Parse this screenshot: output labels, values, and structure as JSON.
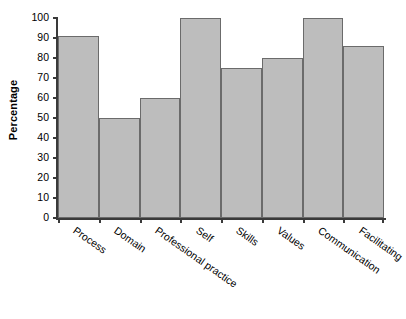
{
  "chart_data": {
    "type": "bar",
    "title": "",
    "subtitle": "",
    "xlabel": "",
    "ylabel": "Percentage",
    "categories": [
      "Process",
      "Domain",
      "Professional practice",
      "Self",
      "Skills",
      "Values",
      "Communication",
      "Facilitating"
    ],
    "values": [
      91,
      50,
      60,
      100,
      75,
      80,
      100,
      86
    ],
    "ylim": [
      0,
      100
    ],
    "ytick_labels": [
      "0",
      "10",
      "20",
      "30",
      "40",
      "50",
      "60",
      "70",
      "80",
      "90",
      "100"
    ],
    "ytick_values": [
      0,
      10,
      20,
      30,
      40,
      50,
      60,
      70,
      80,
      90,
      100
    ],
    "grid": false,
    "legend": null,
    "bar_fill_color": "#bdbdbd",
    "bar_edge_color": "#6b6b6b",
    "axis_color": "#3a3a3a",
    "background_color": "#ffffff",
    "bars_adjacent": true
  }
}
